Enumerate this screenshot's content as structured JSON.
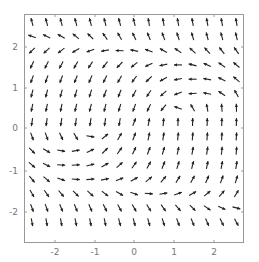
{
  "chart_data": {
    "type": "vector_field",
    "title": "",
    "xlabel": "",
    "ylabel": "",
    "xlim": [
      -2.75,
      2.75
    ],
    "ylim": [
      -2.75,
      2.75
    ],
    "grid": false,
    "x_ticks": [
      "-2",
      "-1",
      "0",
      "1",
      "2"
    ],
    "y_ticks": [
      "2",
      "1",
      "0",
      "-1",
      "-2"
    ],
    "grid_size": [
      15,
      15
    ],
    "arrow_angles_deg_rows_top_to_bottom": [
      [
        105,
        105,
        105,
        105,
        105,
        105,
        105,
        105,
        100,
        100,
        100,
        100,
        100,
        100,
        100
      ],
      [
        160,
        155,
        150,
        140,
        135,
        125,
        120,
        115,
        112,
        110,
        108,
        106,
        105,
        104,
        103
      ],
      [
        225,
        222,
        218,
        210,
        200,
        190,
        178,
        168,
        160,
        150,
        145,
        138,
        132,
        128,
        125
      ],
      [
        245,
        243,
        242,
        240,
        236,
        232,
        226,
        218,
        205,
        192,
        180,
        165,
        155,
        145,
        140
      ],
      [
        250,
        250,
        249,
        248,
        246,
        244,
        240,
        234,
        224,
        210,
        190,
        180,
        170,
        155,
        140
      ],
      [
        255,
        255,
        254,
        254,
        252,
        250,
        248,
        244,
        236,
        222,
        200,
        185,
        170,
        145,
        120
      ],
      [
        258,
        258,
        258,
        257,
        256,
        255,
        253,
        250,
        244,
        230,
        160,
        120,
        100,
        95,
        92
      ],
      [
        262,
        262,
        262,
        262,
        262,
        262,
        260,
        70,
        80,
        85,
        88,
        88,
        88,
        88,
        88
      ],
      [
        290,
        290,
        295,
        300,
        350,
        40,
        60,
        70,
        78,
        82,
        84,
        85,
        86,
        87,
        87
      ],
      [
        315,
        330,
        350,
        10,
        25,
        45,
        55,
        65,
        70,
        74,
        78,
        80,
        82,
        84,
        85
      ],
      [
        320,
        335,
        355,
        5,
        15,
        30,
        42,
        55,
        62,
        68,
        72,
        76,
        78,
        80,
        82
      ],
      [
        310,
        320,
        340,
        355,
        5,
        12,
        22,
        30,
        40,
        50,
        58,
        62,
        66,
        70,
        72
      ],
      [
        300,
        305,
        310,
        315,
        318,
        322,
        330,
        340,
        355,
        10,
        20,
        30,
        40,
        50,
        58
      ],
      [
        290,
        290,
        292,
        292,
        294,
        296,
        298,
        300,
        302,
        305,
        310,
        315,
        325,
        335,
        345
      ],
      [
        280,
        280,
        280,
        282,
        282,
        282,
        284,
        285,
        286,
        288,
        290,
        292,
        294,
        296,
        298
      ]
    ]
  },
  "frame": {
    "left": 24,
    "top": 14,
    "right": 244,
    "bottom": 243
  }
}
